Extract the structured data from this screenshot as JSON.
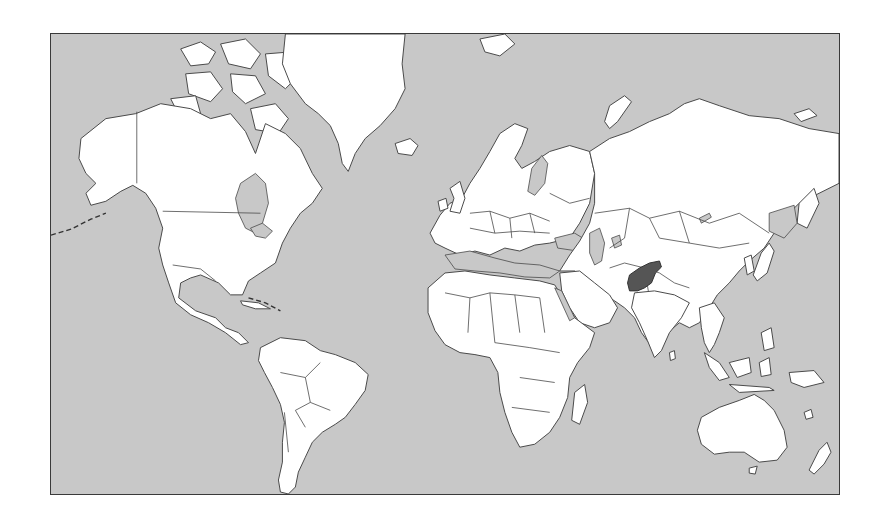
{
  "map": {
    "type": "world-locator-map",
    "projection": "mercator",
    "highlighted_country": "Afghanistan",
    "colors": {
      "ocean": "#c8c8c8",
      "land": "#ffffff",
      "border": "#4a4a4a",
      "highlight": "#555555",
      "frame": "#3a3a3a"
    },
    "regions": [
      {
        "name": "North America"
      },
      {
        "name": "Greenland"
      },
      {
        "name": "South America"
      },
      {
        "name": "Europe"
      },
      {
        "name": "Africa"
      },
      {
        "name": "Asia"
      },
      {
        "name": "Australia"
      },
      {
        "name": "New Zealand"
      },
      {
        "name": "Madagascar"
      },
      {
        "name": "Iceland"
      },
      {
        "name": "Japan"
      },
      {
        "name": "Indonesia"
      }
    ]
  }
}
